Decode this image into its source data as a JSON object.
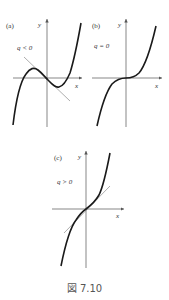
{
  "figure": {
    "caption": "図 7.10",
    "panels": [
      {
        "id": "a",
        "label": "(a)",
        "condition": "q < 0",
        "x_axis": "x",
        "y_axis": "y",
        "description": "cubic with local max and min; tangent line at origin with negative slope"
      },
      {
        "id": "b",
        "label": "(b)",
        "condition": "q = 0",
        "x_axis": "x",
        "y_axis": "y",
        "description": "cubic with horizontal inflection at origin"
      },
      {
        "id": "c",
        "label": "(c)",
        "condition": "q > 0",
        "x_axis": "x",
        "y_axis": "y",
        "description": "monotonic cubic; tangent line at origin with positive slope"
      }
    ]
  },
  "colors": {
    "curve": "#1a1a1a",
    "axis": "#555555",
    "tangent": "#777777"
  }
}
